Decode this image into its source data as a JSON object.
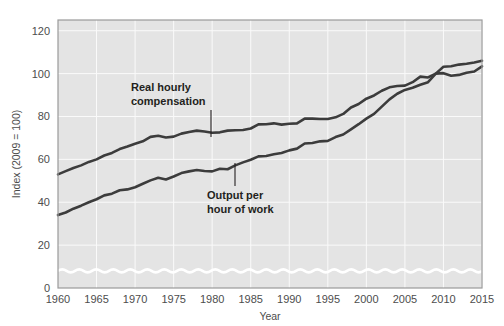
{
  "chart_data": {
    "type": "line",
    "title": "",
    "xlabel": "Year",
    "ylabel": "Index (2009 = 100)",
    "xlim": [
      1960,
      2015
    ],
    "ylim": [
      0,
      125
    ],
    "xticks": [
      1960,
      1965,
      1970,
      1975,
      1980,
      1985,
      1990,
      1995,
      2000,
      2005,
      2010,
      2015
    ],
    "yticks": [
      0,
      20,
      40,
      60,
      80,
      100,
      120
    ],
    "grid": true,
    "legend_position": "inline-annotations",
    "axis_break": "y-axis broken between 0 and 20",
    "line_color": "#3c3c3c",
    "plot_background": "#e4e4e4",
    "gridline_color": "#fafafa",
    "x": [
      1960,
      1961,
      1962,
      1963,
      1964,
      1965,
      1966,
      1967,
      1968,
      1969,
      1970,
      1971,
      1972,
      1973,
      1974,
      1975,
      1976,
      1977,
      1978,
      1979,
      1980,
      1981,
      1982,
      1983,
      1984,
      1985,
      1986,
      1987,
      1988,
      1989,
      1990,
      1991,
      1992,
      1993,
      1994,
      1995,
      1996,
      1997,
      1998,
      1999,
      2000,
      2001,
      2002,
      2003,
      2004,
      2005,
      2006,
      2007,
      2008,
      2009,
      2010,
      2011,
      2012,
      2013,
      2014,
      2015
    ],
    "series": [
      {
        "name": "Real hourly compensation",
        "values": [
          53.0,
          54.5,
          56.0,
          57.2,
          58.8,
          60.0,
          61.8,
          63.0,
          64.8,
          66.0,
          67.3,
          68.4,
          70.5,
          71.0,
          70.2,
          70.6,
          72.0,
          72.8,
          73.4,
          73.0,
          72.4,
          72.6,
          73.4,
          73.6,
          73.7,
          74.4,
          76.3,
          76.4,
          76.8,
          76.2,
          76.6,
          76.8,
          79.0,
          79.0,
          78.8,
          78.8,
          79.6,
          81.2,
          84.2,
          85.8,
          88.3,
          89.8,
          92.0,
          93.6,
          94.2,
          94.4,
          96.0,
          98.6,
          98.2,
          100.0,
          100.2,
          99.0,
          99.4,
          100.4,
          101.0,
          103.4
        ]
      },
      {
        "name": "Output per hour of work",
        "values": [
          34.0,
          35.2,
          37.0,
          38.4,
          40.0,
          41.4,
          43.2,
          44.0,
          45.6,
          46.0,
          47.0,
          48.6,
          50.2,
          51.4,
          50.6,
          52.0,
          53.6,
          54.4,
          55.0,
          54.6,
          54.4,
          55.6,
          55.4,
          57.2,
          58.6,
          59.8,
          61.4,
          61.6,
          62.4,
          63.0,
          64.2,
          65.0,
          67.4,
          67.6,
          68.4,
          68.6,
          70.4,
          71.6,
          74.0,
          76.4,
          79.0,
          81.2,
          84.6,
          88.0,
          90.6,
          92.4,
          93.4,
          94.8,
          96.0,
          100.0,
          103.2,
          103.4,
          104.2,
          104.6,
          105.2,
          106.0
        ]
      }
    ],
    "annotations": [
      {
        "text_line1": "Real hourly",
        "text_line2": "compensation",
        "points_to_series": "Real hourly compensation",
        "points_to_year": 1982
      },
      {
        "text_line1": "Output per",
        "text_line2": "hour of work",
        "points_to_series": "Output per hour of work",
        "points_to_year": 1983
      }
    ]
  },
  "axis": {
    "y_title": "Index (2009 = 100)",
    "x_title": "Year",
    "y_tick_labels": [
      "0",
      "20",
      "40",
      "60",
      "80",
      "100",
      "120"
    ],
    "x_tick_labels": [
      "1960",
      "1965",
      "1970",
      "1975",
      "1980",
      "1985",
      "1990",
      "1995",
      "2000",
      "2005",
      "2010",
      "2015"
    ]
  },
  "annotations": {
    "upper": {
      "line1": "Real hourly",
      "line2": "compensation"
    },
    "lower": {
      "line1": "Output per",
      "line2": "hour of work"
    }
  }
}
